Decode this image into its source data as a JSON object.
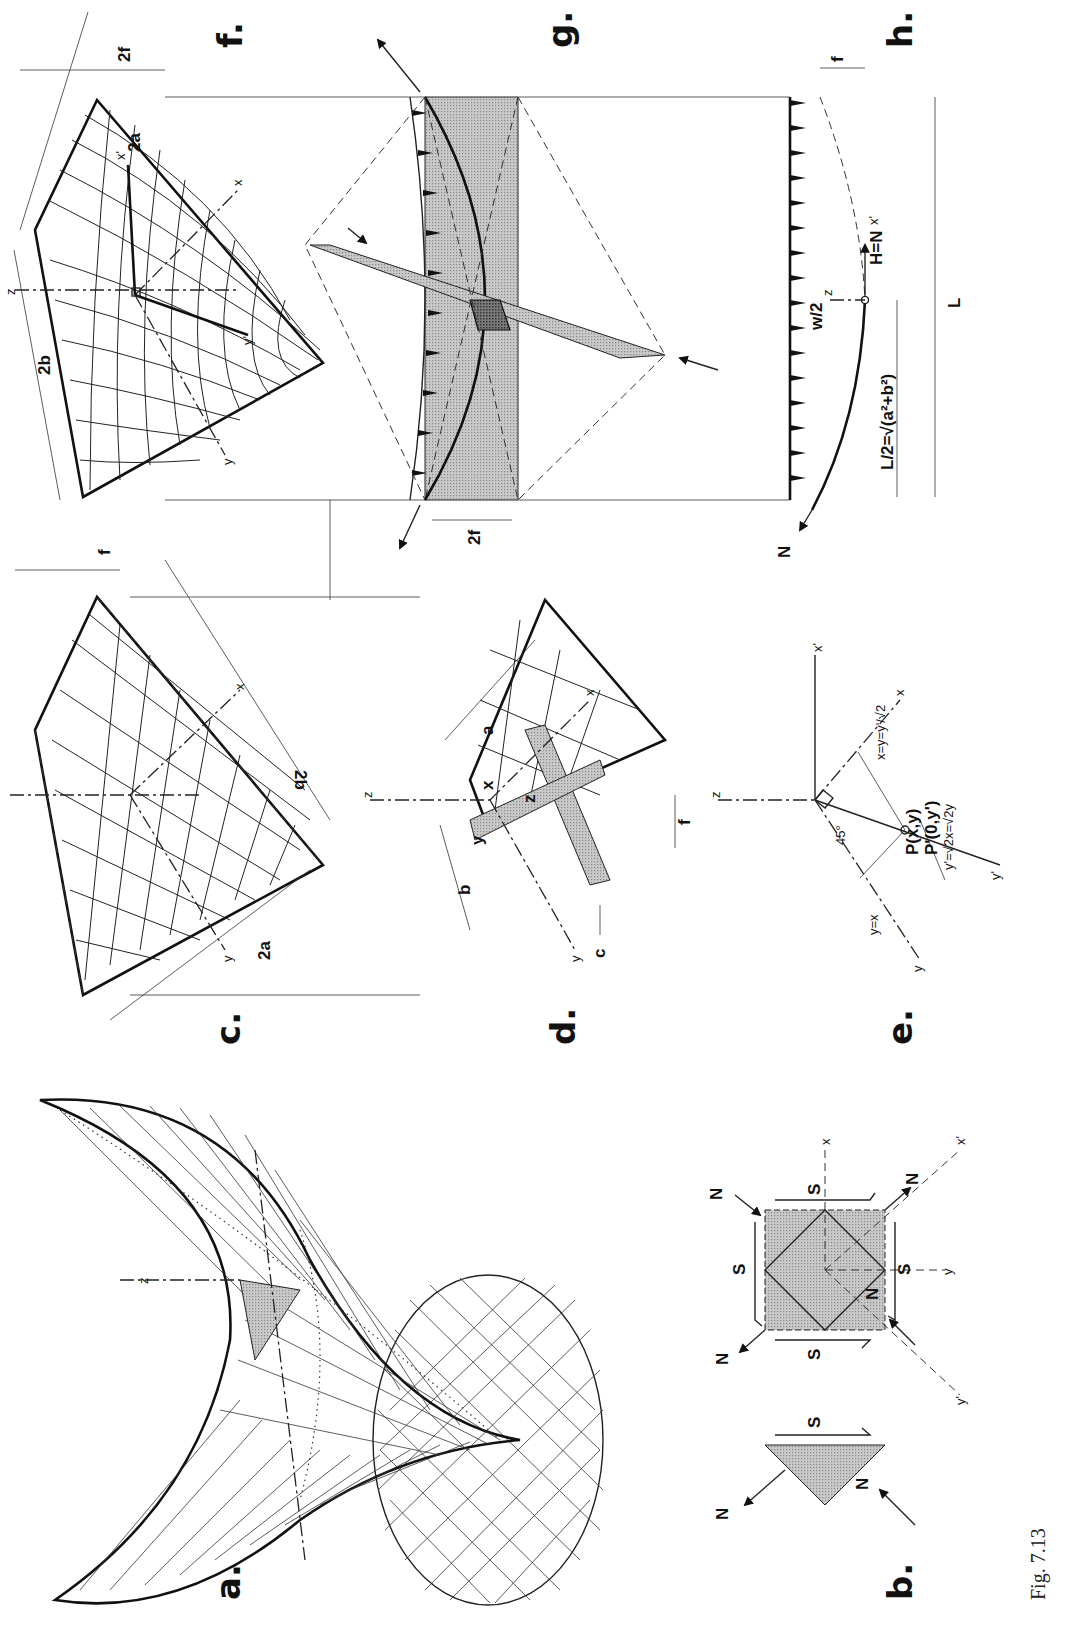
{
  "figure": {
    "caption": "Fig. 7.13",
    "orientation": "rotated -90deg (content reads bottom-to-top)"
  },
  "panels": {
    "a": {
      "letter": "a.",
      "description": "Perspective of hyperbolic paraboloid saddle surface with shaded element",
      "labels": {
        "z_axis": "z"
      }
    },
    "b": {
      "letter": "b.",
      "description": "Shaded element with normal (N) and shear (S) forces",
      "labels": {
        "normal_force": "N",
        "shear_force": "S",
        "x_axis": "x",
        "y_axis": "y",
        "x_prime_axis": "x'",
        "y_prime_axis": "y'"
      }
    },
    "c": {
      "letter": "c.",
      "description": "Hypar on rectangular plan with straight-line generators",
      "labels": {
        "dim_2a": "2a",
        "dim_2b": "2b",
        "dim_f": "f",
        "x_axis": "x",
        "y_axis": "y",
        "z_axis": "z"
      }
    },
    "d": {
      "letter": "d.",
      "description": "Quarter of hypar with strip elements and coordinates",
      "labels": {
        "dim_a": "a",
        "dim_b": "b",
        "dim_c": "c",
        "dim_f": "f",
        "coord_x": "x",
        "coord_y": "y",
        "coord_z": "z",
        "x_axis": "x",
        "y_axis": "y",
        "z_axis": "z"
      }
    },
    "e": {
      "letter": "e.",
      "description": "Coordinate transformation between x,y and x',y' axes",
      "labels": {
        "x_axis": "x",
        "y_axis": "y",
        "x_prime_axis": "x'",
        "y_prime_axis": "y'",
        "z_axis": "z",
        "angle": "45°",
        "line_y_eq_x": "y=x",
        "relation_1": "x=y=y'/√2",
        "point_P": "P(x,y)",
        "point_P_prime": "P'(0,y')",
        "relation_2": "y'=√2x=√2y"
      }
    },
    "f": {
      "letter": "f.",
      "description": "Hypar with curved (parabolic) principal sections",
      "labels": {
        "dim_2a": "2a",
        "dim_2b": "2b",
        "dim_2f": "2f",
        "x_axis": "x",
        "y_axis": "y",
        "x_prime_axis": "x'",
        "y_prime_axis": "y'",
        "z_axis": "z"
      }
    },
    "g": {
      "letter": "g.",
      "description": "Arch and cable action along principal directions with loads",
      "labels": {
        "dim_2f": "2f",
        "force_N": "N"
      }
    },
    "h": {
      "letter": "h.",
      "description": "Parabolic arch/cable under uniform load",
      "labels": {
        "load": "w/2",
        "thrust": "H=N",
        "half_span": "L/2=√(a²+b²)",
        "span": "L",
        "sag": "f",
        "force_N": "N",
        "z_axis": "z",
        "x_prime_axis": "x'"
      }
    }
  }
}
